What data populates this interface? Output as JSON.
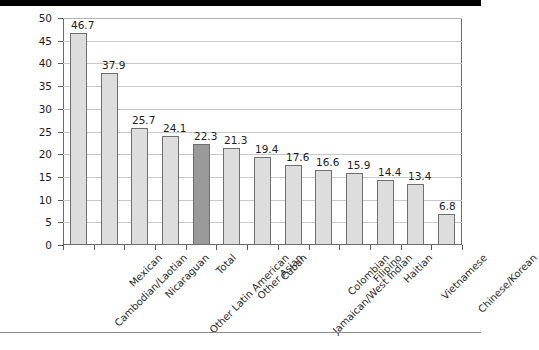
{
  "chart_data": {
    "type": "bar",
    "title": "",
    "subtitle": "",
    "xlabel": "",
    "ylabel": "",
    "ylim": [
      0,
      50
    ],
    "ytick_step": 5,
    "yticks": [
      "50",
      "45",
      "40",
      "35",
      "30",
      "25",
      "20",
      "15",
      "10",
      "5",
      "0"
    ],
    "grid": true,
    "legend": "none",
    "categories": [
      "Cambodian/Laotian",
      "Mexican",
      "Nicaraguan",
      "Other Latin American",
      "Total",
      "Other Asian",
      "Cuban",
      "Jamaican/West Indian",
      "Colombian",
      "Filipino",
      "Haitian",
      "Vietnamese",
      "Chinese/Korean"
    ],
    "values": [
      46.7,
      37.9,
      25.7,
      24.1,
      22.3,
      21.3,
      19.4,
      17.6,
      16.6,
      15.9,
      14.4,
      13.4,
      6.8
    ],
    "value_labels": [
      "46.7",
      "37.9",
      "25.7",
      "24.1",
      "22.3",
      "21.3",
      "19.4",
      "17.6",
      "16.6",
      "15.9",
      "14.4",
      "13.4",
      "6.8"
    ],
    "highlight_category": "Total",
    "colors": {
      "bar_fill": "#dddddd",
      "bar_highlight_fill": "#9a9a9a",
      "bar_edge": "#6f6f6f",
      "gridline": "#c8c8c8",
      "axis": "#6b6b6b",
      "text": "#1c1c1c",
      "top_band": "#000000",
      "bottom_rule": "#8d8d8d",
      "background": "#ffffff"
    }
  }
}
